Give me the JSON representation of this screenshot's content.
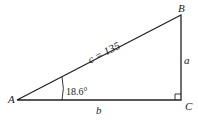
{
  "diagram": {
    "type": "right-triangle",
    "vertices": {
      "A": "A",
      "B": "B",
      "C": "C"
    },
    "sides": {
      "hypotenuse": "c = 135",
      "opposite": "a",
      "adjacent": "b"
    },
    "angle_A": "18.6°",
    "right_angle_at": "C",
    "colors": {
      "stroke": "#222222",
      "background": "#ffffff"
    }
  }
}
